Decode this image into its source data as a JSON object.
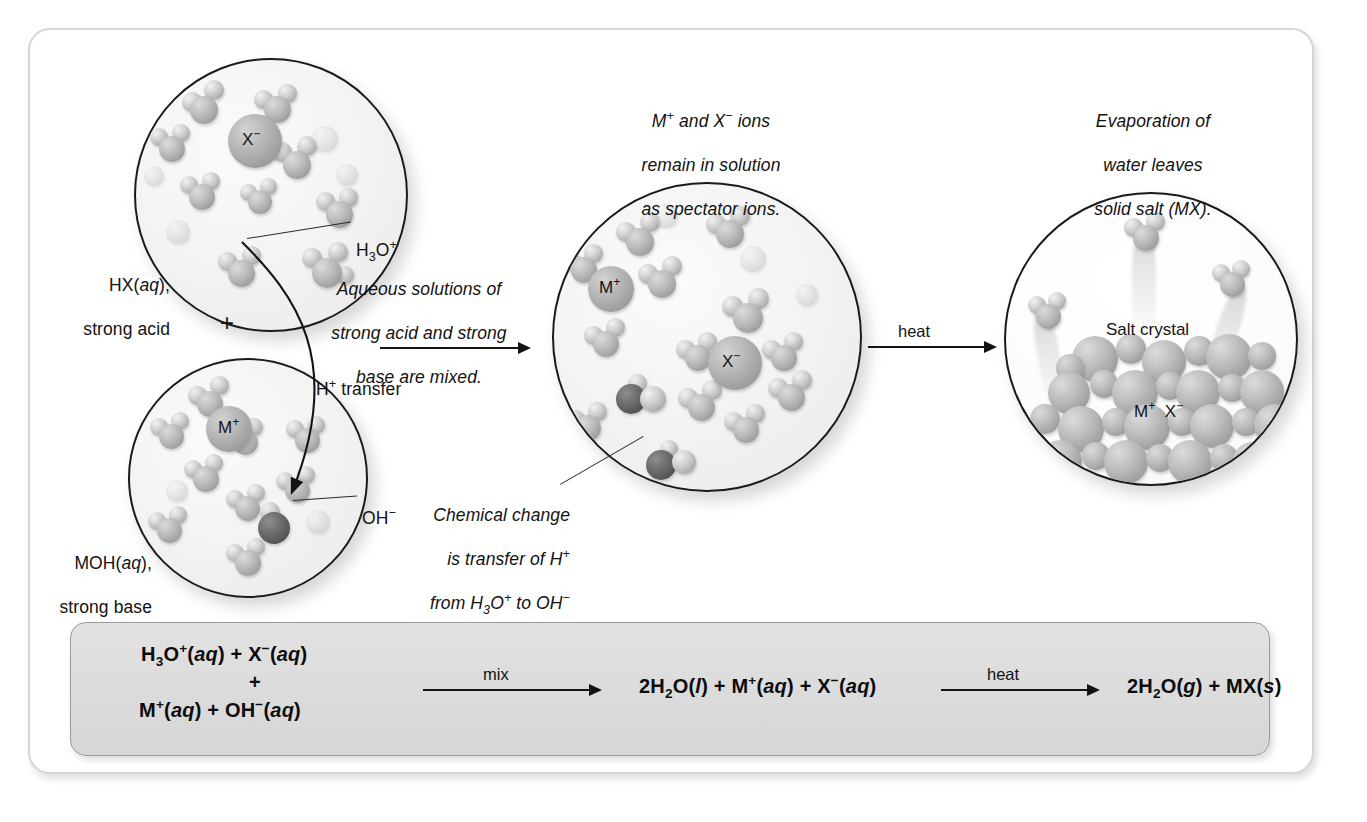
{
  "figure": {
    "type": "chemistry-process-diagram"
  },
  "panels": {
    "acid": {
      "label_line1": "HX(aq),",
      "label_line2": "strong acid",
      "ion_label": "X−",
      "callout_label": "H3O+"
    },
    "base": {
      "label_line1": "MOH(aq),",
      "label_line2": "strong base",
      "ion_label": "M+",
      "callout_label": "OH−"
    },
    "mixture": {
      "caption": "M+ and X− ions remain in solution as spectator ions.",
      "caption_line1": "M+ and X− ions",
      "caption_line2": "remain in solution",
      "caption_line3": "as spectator ions.",
      "ion_label_cation": "M+",
      "ion_label_anion": "X−"
    },
    "crystal": {
      "caption_line1": "Evaporation of",
      "caption_line2": "water leaves",
      "caption_line3": "solid salt (MX).",
      "inner_label": "Salt crystal",
      "lattice_label_cation": "M+",
      "lattice_label_anion": "X−"
    }
  },
  "annotations": {
    "plus_sign": "+",
    "mix_caption_line1": "Aqueous solutions of",
    "mix_caption_line2": "strong acid and strong",
    "mix_caption_line3": "base are mixed.",
    "h_transfer": "H+ transfer",
    "chemical_change_line1": "Chemical change",
    "chemical_change_line2": "is transfer of H+",
    "chemical_change_line3": "from H3O+ to OH−",
    "chemical_change_line4": "forming H2O."
  },
  "arrows": {
    "mix_arrow_label": "",
    "heat_arrow_label": "heat"
  },
  "equation": {
    "reactant_line1": "H3O+(aq) + X−(aq)",
    "reactant_plus": "+",
    "reactant_line2": "M+(aq) + OH−(aq)",
    "arrow1_label": "mix",
    "product1": "2H2O(l) + M+(aq) + X−(aq)",
    "arrow2_label": "heat",
    "product2": "2H2O(g) + MX(s)"
  },
  "colors": {
    "frame_border": "#d5d5d5",
    "circle_stroke": "#1a1a1a",
    "panel_bg": "#dcdcdc",
    "panel_border": "#9a9a9a",
    "text": "#121212"
  }
}
